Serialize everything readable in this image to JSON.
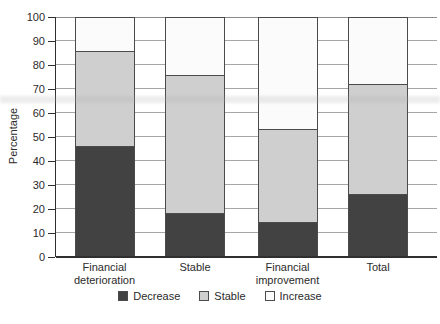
{
  "figure": {
    "background": "#ffffff"
  },
  "chart_data": {
    "type": "bar",
    "stacked": true,
    "orientation": "vertical",
    "title": "",
    "xlabel": "",
    "ylabel": "Percentage",
    "ylim": [
      0,
      100
    ],
    "yticks": [
      0,
      10,
      20,
      30,
      40,
      50,
      60,
      70,
      80,
      90,
      100
    ],
    "grid": true,
    "legend_position": "bottom",
    "categories": [
      "Financial deterioration",
      "Stable",
      "Financial improvement",
      "Total"
    ],
    "series": [
      {
        "name": "Decrease",
        "color": "#424242",
        "values": [
          46,
          18,
          14,
          26
        ]
      },
      {
        "name": "Stable",
        "color": "#cfcfcf",
        "values": [
          40,
          58,
          39,
          46
        ]
      },
      {
        "name": "Increase",
        "color": "#fbfbfb",
        "values": [
          14,
          24,
          47,
          28
        ]
      }
    ],
    "segment_boundaries_note": "cumulative tops: deterioration 46/86/100, stable 18/76/100, improvement 14/53/100, total 26/72/100"
  }
}
